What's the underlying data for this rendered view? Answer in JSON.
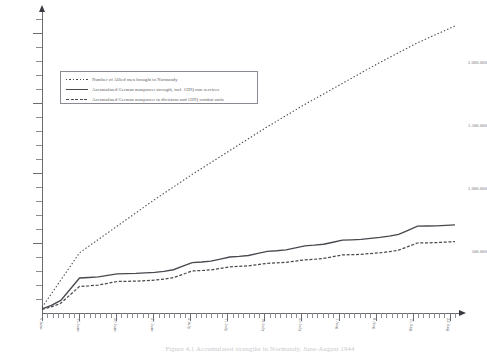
{
  "figure": {
    "caption": "Figure 4.1 Accumulated strengths in Normandy, June-August 1944"
  },
  "legend": {
    "items": [
      {
        "marker": "dotted-line-icon",
        "label": "Number of Allied men brought to Normandy"
      },
      {
        "marker": "solid-line-icon",
        "label": "Accumulated German manpower strength, incl. GHQ non services"
      },
      {
        "marker": "dashed-line-icon",
        "label": "Accumulated German manpower in divisions and GHQ combat units"
      }
    ]
  },
  "axes": {
    "y": {
      "title": "",
      "labels": [
        "500.000",
        "1.000.000",
        "1.500.000",
        "2.000.000"
      ],
      "values": [
        500000,
        1000000,
        1500000,
        2000000
      ],
      "min": 0,
      "max": 2150000,
      "minor_step": 100000
    },
    "x": {
      "title": "",
      "labels": [
        "6 June",
        "13 June",
        "20 June",
        "27 June",
        "4 July",
        "11 July",
        "18 July",
        "25 July",
        "1 Aug",
        "8 Aug",
        "15 Aug",
        "22 Aug"
      ],
      "minor_tick_count": 78
    }
  },
  "chart_data": {
    "type": "line",
    "title": "Accumulated strengths in Normandy, June-August 1944",
    "xlabel": "",
    "ylabel": "",
    "ylim": [
      0,
      2150000
    ],
    "grid": false,
    "legend_position": "upper-left",
    "x": [
      "6 June",
      "13 June",
      "20 June",
      "27 June",
      "4 July",
      "11 July",
      "18 July",
      "25 July",
      "1 Aug",
      "8 Aug",
      "15 Aug",
      "22 Aug"
    ],
    "series": [
      {
        "name": "Number of Allied men brought to Normandy",
        "style": "dotted",
        "color": "#4a484f",
        "values": [
          40000,
          430000,
          620000,
          810000,
          990000,
          1160000,
          1330000,
          1490000,
          1640000,
          1790000,
          1930000,
          2050000
        ]
      },
      {
        "name": "Accumulated German manpower strength, incl. GHQ non services",
        "style": "solid",
        "color": "#4a484f",
        "values": [
          30000,
          250000,
          280000,
          290000,
          360000,
          400000,
          440000,
          480000,
          520000,
          540000,
          620000,
          630000
        ]
      },
      {
        "name": "Accumulated German manpower in divisions and GHQ combat units",
        "style": "dashed",
        "color": "#4a484f",
        "values": [
          25000,
          190000,
          225000,
          235000,
          300000,
          330000,
          355000,
          380000,
          415000,
          430000,
          500000,
          510000
        ]
      }
    ]
  }
}
